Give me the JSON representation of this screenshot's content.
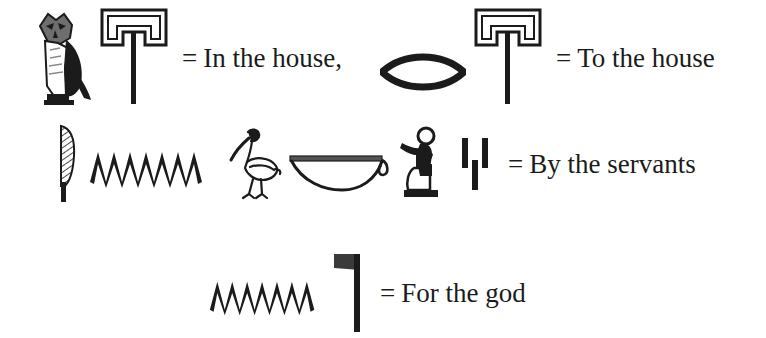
{
  "figure": {
    "background_color": "#ffffff",
    "ink_color": "#1b1b1b",
    "caption_font_style": "serif"
  },
  "equals_sign": "=",
  "entries": [
    {
      "id": "in-the-house",
      "gloss": "In the house,",
      "glyphs": [
        {
          "name": "owl-glyph",
          "transliteration": "m",
          "meaning": "owl"
        },
        {
          "name": "house-glyph",
          "transliteration": "pr",
          "meaning": "house"
        }
      ]
    },
    {
      "id": "to-the-house",
      "gloss": "To the house",
      "glyphs": [
        {
          "name": "mouth-glyph",
          "transliteration": "r",
          "meaning": "mouth"
        },
        {
          "name": "house-glyph",
          "transliteration": "pr",
          "meaning": "house"
        }
      ]
    },
    {
      "id": "by-the-servants",
      "gloss": "By the servants",
      "glyphs": [
        {
          "name": "reed-leaf-glyph",
          "transliteration": "in",
          "meaning": "reed leaf"
        },
        {
          "name": "water-ripple-glyph",
          "transliteration": "n",
          "meaning": "water"
        },
        {
          "name": "ibis-bird-glyph",
          "transliteration": "hm",
          "meaning": "crested ibis"
        },
        {
          "name": "basket-glyph",
          "transliteration": "nb",
          "meaning": "basket"
        },
        {
          "name": "seated-servant-glyph",
          "transliteration": "hm",
          "meaning": "seated servant"
        },
        {
          "name": "plural-strokes-glyph",
          "transliteration": "w",
          "meaning": "plural strokes"
        }
      ]
    },
    {
      "id": "for-the-god",
      "gloss": "For the god",
      "glyphs": [
        {
          "name": "water-ripple-glyph",
          "transliteration": "n",
          "meaning": "water"
        },
        {
          "name": "god-flag-glyph",
          "transliteration": "ntr",
          "meaning": "god / flag on pole"
        }
      ]
    }
  ]
}
